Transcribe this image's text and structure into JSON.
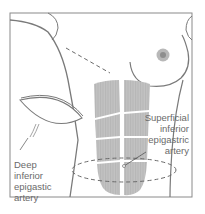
{
  "figure": {
    "type": "anatomical-illustration",
    "colors": {
      "outline": "#7a7a7a",
      "muscle": "#bdbdbd",
      "muscle_stripe": "#a8a8a8",
      "nipple_outer": "#b0b0b0",
      "nipple_inner": "#8a8a8a",
      "dashed": "#6a6a6a"
    }
  },
  "labels": {
    "superficial": {
      "line1": "Superficial",
      "line2": "inferior",
      "line3": "epigastric",
      "line4": "artery"
    },
    "deep": {
      "line1": "Deep",
      "line2": "inferior",
      "line3": "epigastic",
      "line4": "artery"
    }
  }
}
